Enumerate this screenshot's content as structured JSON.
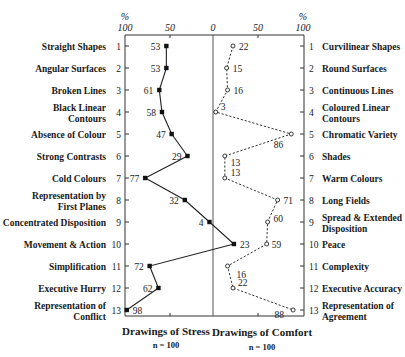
{
  "chart_data": {
    "type": "line",
    "title": "",
    "axis_top": {
      "left_unit": "%",
      "right_unit": "%",
      "ticks": [
        "100",
        "50",
        "0",
        "50",
        "100"
      ]
    },
    "row_numbers": [
      "1",
      "2",
      "3",
      "4",
      "5",
      "6",
      "7",
      "8",
      "9",
      "10",
      "11",
      "12",
      "13"
    ],
    "left_categories": [
      "Straight Shapes",
      "Angular Surfaces",
      "Broken Lines",
      "Black Linear Contours",
      "Absence of Colour",
      "Strong Contrasts",
      "Cold Colours",
      "Representation by First Planes",
      "Concentrated Disposition",
      "Movement & Action",
      "Simplification",
      "Executive Hurry",
      "Representation of Conflict"
    ],
    "right_categories": [
      "Curvilinear Shapes",
      "Round Surfaces",
      "Continuous Lines",
      "Coloured Linear Contours",
      "Chromatic Variety",
      "Shades",
      "Warm Colours",
      "Long Fields",
      "Spread & Extended Disposition",
      "Peace",
      "Complexity",
      "Executive Accuracy",
      "Representation of Agreement"
    ],
    "series": [
      {
        "name": "Drawings of Stress",
        "n": "n = 100",
        "style": "solid line, filled square markers",
        "side": "left",
        "values": [
          53,
          53,
          61,
          58,
          47,
          29,
          77,
          32,
          4,
          23,
          72,
          62,
          98
        ],
        "value_labels": [
          "53",
          "53",
          "61",
          "58",
          "47",
          "29",
          "77",
          "32",
          "4",
          "23",
          "72",
          "62",
          "98"
        ],
        "plotted_on_right_side": [
          10
        ]
      },
      {
        "name": "Drawings of Comfort",
        "n": "n = 100",
        "style": "dashed line, open circle markers",
        "side": "right",
        "values": [
          22,
          15,
          16,
          3,
          86,
          13,
          13,
          71,
          60,
          59,
          16,
          22,
          88
        ],
        "value_labels": [
          "22",
          "15",
          "16",
          "3",
          "86",
          "13",
          "13",
          "71",
          "60",
          "59",
          "16",
          "22",
          "88"
        ]
      }
    ],
    "xlim_left": [
      100,
      0
    ],
    "xlim_right": [
      0,
      100
    ],
    "grid": false,
    "legend": "series names below plot"
  },
  "footer": {
    "stress_title": "Drawings of Stress",
    "stress_n": "n = 100",
    "comfort_title": "Drawings of Comfort",
    "comfort_n": "n = 100"
  }
}
